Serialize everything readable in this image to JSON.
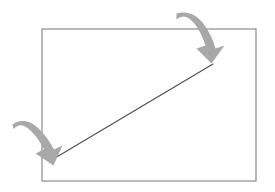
{
  "canvas": {
    "width": 275,
    "height": 192,
    "background": "#ffffff"
  },
  "diagram": {
    "shapes": {
      "rectangle": {
        "name": "rectangle-outline",
        "x": 42,
        "y": 29,
        "width": 214,
        "height": 152,
        "stroke": "#8a8a8a",
        "stroke_width": 1.2,
        "fill": "none"
      },
      "diagonal_line": {
        "name": "diagonal-line",
        "x1": 55,
        "y1": 158,
        "x2": 213,
        "y2": 64,
        "stroke": "#4d4d4d",
        "stroke_width": 1.1
      },
      "arrows": [
        {
          "name": "curved-arrow-top-right",
          "fill": "#a8a8a8",
          "start_x": 180,
          "start_y": 12,
          "tip_x": 212,
          "tip_y": 63,
          "direction": "down-right",
          "path": "M 176.5 13.5 C 186 10.5 195.5 13.5 202.5 22.5 C 209.5 31.5 213.5 41 215.5 48.5 L 224.5 45.5 L 211.5 63.5 L 196.5 48.5 L 205.5 45.5 C 203 38 199.5 29.5 193.5 22.5 C 187.5 15.5 182.5 14.5 176.5 19.5 Z"
        },
        {
          "name": "curved-arrow-bottom-left",
          "fill": "#a8a8a8",
          "start_x": 14,
          "start_y": 123,
          "tip_x": 54,
          "tip_y": 160,
          "direction": "down-right",
          "path": "M 12.5 124.5 C 20.5 118.5 30.5 120.5 38.5 128.5 C 46 136 51 143.5 54 149.5 L 62.5 145.5 L 53.5 165.5 L 35.5 153.5 L 44 149.5 C 41 143.5 36.5 136 30 130 C 23.5 124 18.5 123.5 13.5 129 Z"
        }
      ]
    },
    "colors": {
      "arrow_fill": "#a8a8a8",
      "rectangle_stroke": "#8a8a8a",
      "line_stroke": "#4d4d4d",
      "background": "#ffffff"
    }
  }
}
